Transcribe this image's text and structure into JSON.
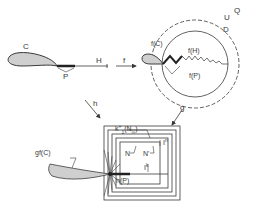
{
  "diagram": {
    "colors": {
      "ink": "#3a3a3a",
      "fill": "#cfcfcf",
      "background": "#ffffff"
    },
    "top_left": {
      "curve_label": "C",
      "segment_label": "P",
      "ray_label": "H"
    },
    "arrows": {
      "f": "f",
      "h": "h",
      "g": "g"
    },
    "top_right": {
      "outer_region_label": "Q",
      "dashed_circle_label": "U",
      "solid_circle_label": "D",
      "curve_image_label": "f(C)",
      "segment_image_label": "f(P)",
      "ray_image_label": "f(H)"
    },
    "bottom": {
      "curve_image_label": "gf(C)",
      "segment_image_label": "h(P)",
      "nested_label": "k",
      "nested_label_sup": "+",
      "nested_label_sub": "1",
      "nested_label_arg": "(N",
      "nested_label_arg_sub": "∞",
      "nested_label_close": ")",
      "inner_left_label": "N",
      "inner_right_label": "N'",
      "interval_label_n": "I",
      "interval_label_n_sup": "n",
      "interval_label_k": "I",
      "interval_label_k_sup": "k"
    }
  }
}
